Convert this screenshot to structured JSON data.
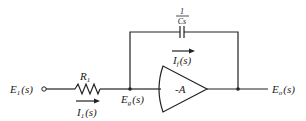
{
  "diagram": {
    "type": "circuit",
    "labels": {
      "input_voltage": "E",
      "input_voltage_sub": "1",
      "input_voltage_arg": "(s)",
      "resistor": "R",
      "resistor_sub": "1",
      "input_current": "I",
      "input_current_sub": "1",
      "input_current_arg": "(s)",
      "node_voltage": "E",
      "node_voltage_sub": "g",
      "node_voltage_arg": "(s)",
      "feedback_current": "I",
      "feedback_current_sub": "f",
      "feedback_current_arg": "(s)",
      "capacitor_numerator": "1",
      "capacitor_denominator": "Cs",
      "amplifier_gain": "-A",
      "output_voltage": "E",
      "output_voltage_sub": "o",
      "output_voltage_arg": "(s)"
    },
    "components": [
      {
        "id": "R1",
        "kind": "resistor",
        "label": "R1"
      },
      {
        "id": "C",
        "kind": "capacitor",
        "label": "1/Cs"
      },
      {
        "id": "amp",
        "kind": "amplifier",
        "label": "-A"
      }
    ],
    "nodes": [
      "E1(s)",
      "Eg(s)",
      "Eo(s)"
    ],
    "currents": [
      "I1(s)",
      "If(s)"
    ],
    "colors": {
      "ink": "#222222",
      "background": "#ffffff"
    }
  }
}
